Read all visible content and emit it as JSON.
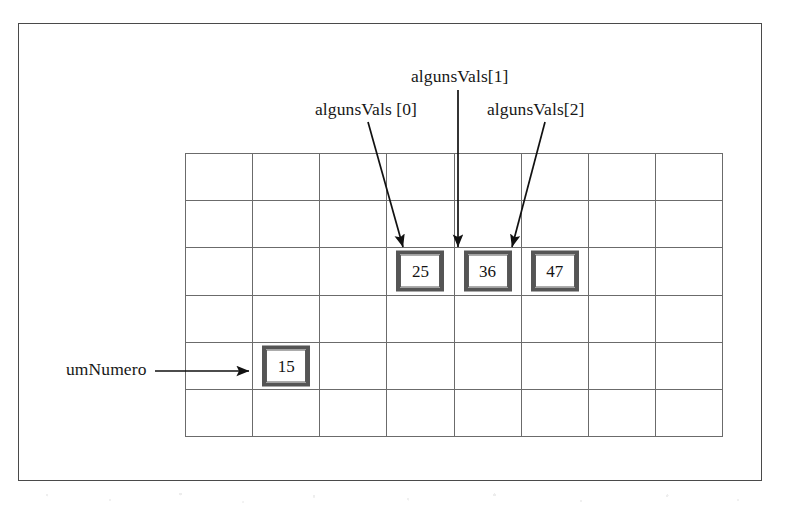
{
  "diagram": {
    "frame": {
      "border_color": "#4a4a4a"
    },
    "grid": {
      "columns": 8,
      "rows": 6,
      "line_color": "#6b6b6b"
    },
    "box_style": {
      "border_color": "#555555",
      "fill_color": "#ffffff",
      "text_color": "#131313"
    },
    "cells": [
      {
        "name": "algunsVals-0",
        "value": "25",
        "row": 3,
        "col": 4
      },
      {
        "name": "algunsVals-1",
        "value": "36",
        "row": 3,
        "col": 5
      },
      {
        "name": "algunsVals-2",
        "value": "47",
        "row": 3,
        "col": 6
      },
      {
        "name": "umNumero",
        "value": "15",
        "row": 5,
        "col": 2
      }
    ],
    "labels": {
      "algunsVals_0": "algunsVals [0]",
      "algunsVals_1": "algunsVals[1]",
      "algunsVals_2": "algunsVals[2]",
      "umNumero": "umNumero"
    },
    "arrows": [
      {
        "name": "arrow-to-algunsVals-0",
        "from": "algunsVals [0]",
        "to": "25",
        "direction": "diagonal-down-right"
      },
      {
        "name": "arrow-to-algunsVals-1",
        "from": "algunsVals[1]",
        "to": "36",
        "direction": "vertical-down"
      },
      {
        "name": "arrow-to-algunsVals-2",
        "from": "algunsVals[2]",
        "to": "47",
        "direction": "diagonal-down-left"
      },
      {
        "name": "arrow-to-umNumero",
        "from": "umNumero",
        "to": "15",
        "direction": "horizontal-right"
      }
    ]
  }
}
